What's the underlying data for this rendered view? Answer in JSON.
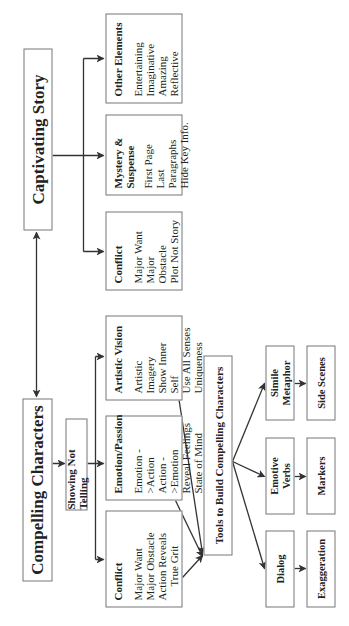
{
  "diagram": {
    "orientation": "rotated -90 degrees (text reads bottom-to-top)",
    "captivating_story": {
      "title": "Captivating Story",
      "children": [
        {
          "title": "Conflict",
          "items": [
            "Major Want",
            "Major Obstacle",
            "Plot Not Story"
          ]
        },
        {
          "title": "Mystery & Suspense",
          "title_lines": [
            "Mystery &",
            "Suspense"
          ],
          "items": [
            "First Page",
            "Last Paragraphs",
            "Hide Key Info."
          ]
        },
        {
          "title": "Other Elements",
          "items": [
            "Entertaining",
            "Imaginative",
            "Amazing",
            "Reflective"
          ]
        }
      ]
    },
    "compelling_characters": {
      "title": "Compelling Characters",
      "showing_not_telling": "Showing Not Telling",
      "children": [
        {
          "title": "Conflict",
          "items": [
            "Major Want",
            "Major Obstacle",
            "Action Reveals",
            "True Grit"
          ]
        },
        {
          "title": "Emotion/Passion",
          "items": [
            "Emotion ->Action",
            "Action ->Emotion",
            "Reveal Feelings",
            "State of Mind"
          ]
        },
        {
          "title": "Artistic Vision",
          "items": [
            "Artistic Imagery",
            "Show Inner Self",
            "Use All Senses",
            "Uniqueness"
          ]
        }
      ]
    },
    "tools": {
      "title": "Tools to Build Compelling Characters",
      "items": [
        {
          "label": "Dialog",
          "next": "Exaggeration"
        },
        {
          "label": "Emotive Verbs",
          "label_lines": [
            "Emotive",
            "Verbs"
          ],
          "next": "Markers"
        },
        {
          "label": "Simile Metaphor",
          "label_lines": [
            "Simile",
            "Metaphor"
          ],
          "next": "Side Scenes"
        }
      ]
    },
    "colors": {
      "line": "#333333",
      "border": "#777777",
      "background": "#ffffff",
      "text": "#222222"
    }
  }
}
